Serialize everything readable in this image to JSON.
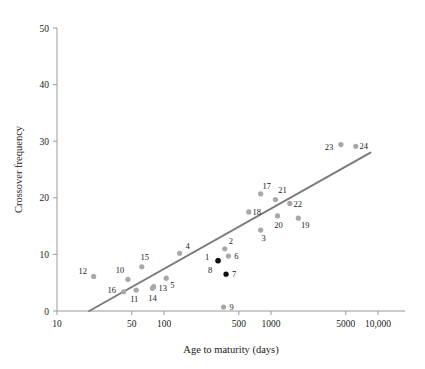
{
  "chart_data": {
    "type": "scatter",
    "title": "",
    "xlabel": "Age to maturity (days)",
    "ylabel": "Crossover frequency",
    "xscale": "log",
    "yscale": "linear",
    "xlim": [
      10,
      10000
    ],
    "ylim": [
      0,
      50
    ],
    "xticks": [
      10,
      50,
      100,
      500,
      1000,
      5000,
      10000
    ],
    "xticklabels": [
      "10",
      "50",
      "100",
      "500",
      "1000",
      "5000",
      "10,000"
    ],
    "yticks": [
      0,
      10,
      20,
      30,
      40,
      50
    ],
    "yticklabels": [
      "0",
      "10",
      "20",
      "30",
      "40",
      "50"
    ],
    "grid": false,
    "legend": false,
    "marker_color": "#a8a8a8",
    "highlight_color": "#111111",
    "trendline_color": "#7a7a7a",
    "trendline": {
      "x": [
        20,
        8500
      ],
      "y": [
        0.0,
        28.0
      ]
    },
    "points": [
      {
        "label": "1",
        "x": 320,
        "y": 8.9,
        "color": "#111111",
        "label_dx": -11,
        "label_dy": -1
      },
      {
        "label": "2",
        "x": 370,
        "y": 11.0,
        "color": "#a8a8a8",
        "label_dx": 6,
        "label_dy": -5
      },
      {
        "label": "3",
        "x": 800,
        "y": 14.3,
        "color": "#a8a8a8",
        "label_dx": 3,
        "label_dy": 11
      },
      {
        "label": "4",
        "x": 140,
        "y": 10.2,
        "color": "#a8a8a8",
        "label_dx": 8,
        "label_dy": -4
      },
      {
        "label": "5",
        "x": 105,
        "y": 5.8,
        "color": "#a8a8a8",
        "label_dx": 6,
        "label_dy": 10
      },
      {
        "label": "6",
        "x": 400,
        "y": 9.7,
        "color": "#a8a8a8",
        "label_dx": 8,
        "label_dy": 3
      },
      {
        "label": "7",
        "x": 380,
        "y": 6.5,
        "color": "#111111",
        "label_dx": 8,
        "label_dy": 3
      },
      {
        "label": "8",
        "x": 320,
        "y": 8.9,
        "color": "#111111",
        "label_dx": -8,
        "label_dy": 12
      },
      {
        "label": "9",
        "x": 360,
        "y": 0.7,
        "color": "#a8a8a8",
        "label_dx": 8,
        "label_dy": 3
      },
      {
        "label": "10",
        "x": 46,
        "y": 5.6,
        "color": "#a8a8a8",
        "label_dx": -8,
        "label_dy": -6
      },
      {
        "label": "11",
        "x": 55,
        "y": 3.7,
        "color": "#a8a8a8",
        "label_dx": -2,
        "label_dy": 12
      },
      {
        "label": "12",
        "x": 22,
        "y": 6.1,
        "color": "#a8a8a8",
        "label_dx": -11,
        "label_dy": -2
      },
      {
        "label": "13",
        "x": 80,
        "y": 4.3,
        "color": "#a8a8a8",
        "label_dx": 9,
        "label_dy": 4
      },
      {
        "label": "14",
        "x": 78,
        "y": 4.0,
        "color": "#a8a8a8",
        "label_dx": 0,
        "label_dy": 13
      },
      {
        "label": "15",
        "x": 62,
        "y": 7.8,
        "color": "#a8a8a8",
        "label_dx": 3,
        "label_dy": -7
      },
      {
        "label": "16",
        "x": 42,
        "y": 3.4,
        "color": "#a8a8a8",
        "label_dx": -12,
        "label_dy": 1
      },
      {
        "label": "17",
        "x": 800,
        "y": 20.7,
        "color": "#a8a8a8",
        "label_dx": 6,
        "label_dy": -5
      },
      {
        "label": "18",
        "x": 620,
        "y": 17.5,
        "color": "#a8a8a8",
        "label_dx": 8,
        "label_dy": 3
      },
      {
        "label": "19",
        "x": 1800,
        "y": 16.4,
        "color": "#a8a8a8",
        "label_dx": 7,
        "label_dy": 10
      },
      {
        "label": "20",
        "x": 1150,
        "y": 16.8,
        "color": "#a8a8a8",
        "label_dx": 1,
        "label_dy": 12
      },
      {
        "label": "21",
        "x": 1100,
        "y": 19.7,
        "color": "#a8a8a8",
        "label_dx": 7,
        "label_dy": -6
      },
      {
        "label": "22",
        "x": 1500,
        "y": 19.0,
        "color": "#a8a8a8",
        "label_dx": 8,
        "label_dy": 4
      },
      {
        "label": "23",
        "x": 4500,
        "y": 29.4,
        "color": "#a8a8a8",
        "label_dx": -12,
        "label_dy": 5
      },
      {
        "label": "24",
        "x": 6200,
        "y": 29.1,
        "color": "#a8a8a8",
        "label_dx": 8,
        "label_dy": 3
      }
    ]
  }
}
